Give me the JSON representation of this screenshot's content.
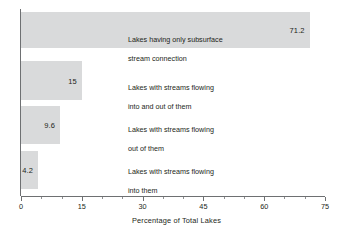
{
  "chart_data": {
    "type": "bar",
    "orientation": "horizontal",
    "title": "",
    "xlabel": "Percentage of Total Lakes",
    "ylabel": "",
    "xlim": [
      0,
      75
    ],
    "xticks": [
      0,
      15,
      30,
      45,
      60,
      75
    ],
    "xtick_labels": [
      "0",
      "15",
      "30",
      "45",
      "60",
      "75"
    ],
    "minor_tick_interval": 5,
    "grid": false,
    "legend": null,
    "bar_color": "#d9dadb",
    "axis_color": "#6e7072",
    "text_color": "#231f20",
    "categories": [
      "Lakes having only subsurface stream connection",
      "Lakes with streams flowing into and out of them",
      "Lakes with streams flowing out of them",
      "Lakes with streams flowing into them"
    ],
    "values": [
      71.2,
      15,
      9.6,
      4.2
    ],
    "value_labels": [
      "71.2",
      "15",
      "9.6",
      "4.2"
    ],
    "bars": [
      {
        "value": 71.2,
        "value_label": "71.2",
        "label_line1": "Lakes having only subsurface",
        "label_line2": "stream connection"
      },
      {
        "value": 15,
        "value_label": "15",
        "label_line1": "Lakes with streams flowing",
        "label_line2": "into and out of them"
      },
      {
        "value": 9.6,
        "value_label": "9.6",
        "label_line1": "Lakes with streams flowing",
        "label_line2": "out of them"
      },
      {
        "value": 4.2,
        "value_label": "4.2",
        "label_line1": "Lakes with streams flowing",
        "label_line2": "into them"
      }
    ]
  }
}
